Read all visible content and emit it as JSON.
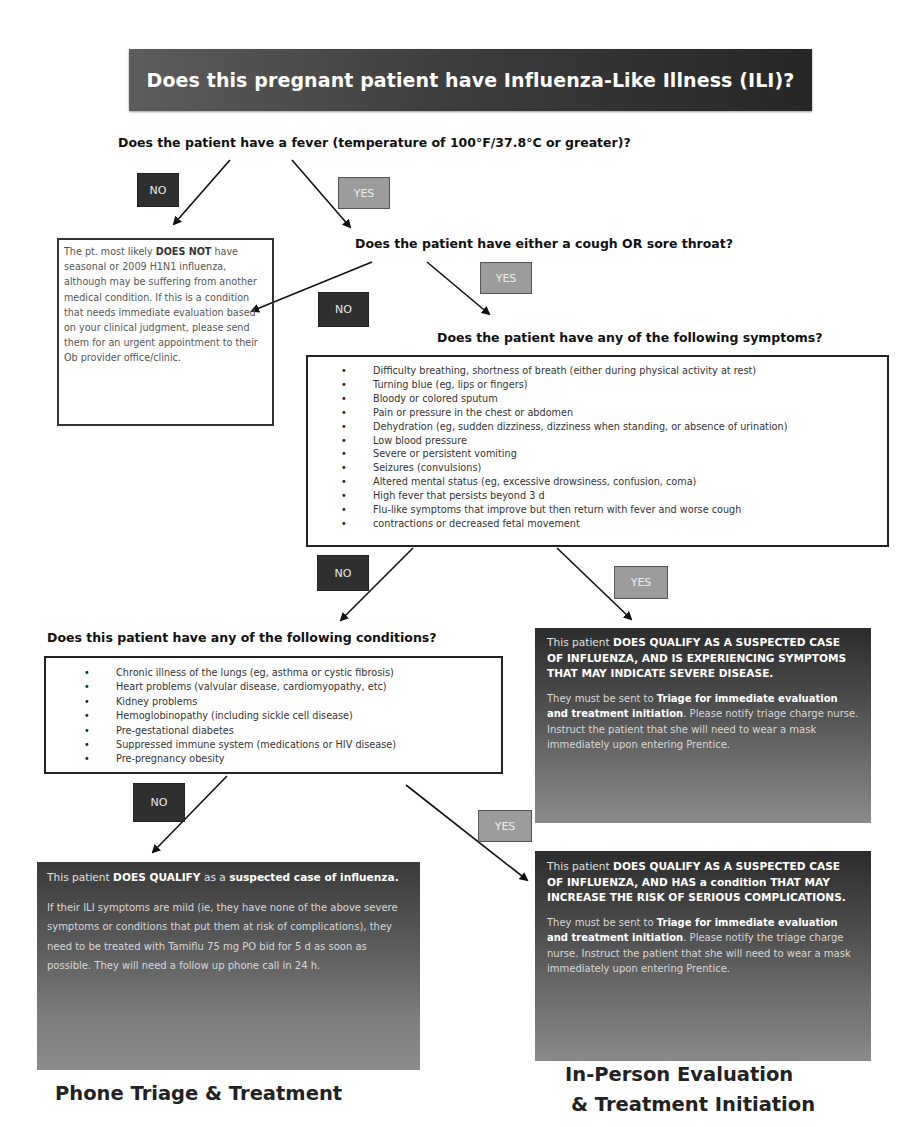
{
  "title": "Does this pregnant patient have Influenza-Like Illness (ILI)?",
  "questions": {
    "fever": "Does the patient have a fever (temperature of 100°F/37.8°C or greater)?",
    "cough": "Does the patient have either a cough OR sore throat?",
    "symptoms": "Does the patient have any of the following symptoms?",
    "conditions": "Does this patient have any of the following conditions?"
  },
  "branch_labels": {
    "no": "NO",
    "yes": "YES"
  },
  "not_influenza": {
    "prefix": "The pt. most likely ",
    "bold": "DOES NOT",
    "rest": " have seasonal or 2009 H1N1 influenza, although may be suffering from another medical condition. If this is a condition that needs immediate evaluation based on your clinical judgment, please send them for an urgent appointment to their Ob provider office/clinic."
  },
  "symptoms": [
    "Difficulty breathing, shortness of breath (either during physical activity at rest)",
    "Turning blue (eg, lips or fingers)",
    "Bloody or colored sputum",
    "Pain or pressure in the chest or abdomen",
    "Dehydration (eg, sudden dizziness, dizziness when standing, or absence of urination)",
    "Low blood pressure",
    "Severe or persistent vomiting",
    "Seizures (convulsions)",
    "Altered mental status (eg, excessive drowsiness, confusion, coma)",
    "High fever that persists beyond 3 d",
    "Flu-like symptoms that improve but then return with fever and worse cough",
    "contractions or decreased fetal movement"
  ],
  "conditions": [
    "Chronic illness of the lungs (eg, asthma or cystic fibrosis)",
    "Heart problems (valvular disease, cardiomyopathy, etc)",
    "Kidney problems",
    "Hemoglobinopathy (including sickle cell disease)",
    "Pre-gestational diabetes",
    "Suppressed immune system (medications or HIV disease)",
    "Pre-pregnancy obesity"
  ],
  "severe_disease": {
    "lead_prefix": "This patient ",
    "lead_caps": "DOES QUALIFY AS A SUSPECTED CASE OF INFLUENZA, AND IS EXPERIENCING SYMPTOMS THAT MAY INDICATE SEVERE DISEASE.",
    "body_prefix": "They must be sent to ",
    "body_bold": "Triage for immediate evaluation and treatment initiation",
    "body_rest": ".  Please notify triage charge nurse.  Instruct the patient that she will need to wear a mask immediately upon entering Prentice."
  },
  "risk_condition": {
    "lead_prefix": "This patient ",
    "lead_caps_1": "DOES QUALIFY AS A SUSPECTED CASE OF INFLUENZA, AND HAS",
    "lead_mid": " a condition ",
    "lead_caps_2": "THAT MAY INCREASE THE RISK OF SERIOUS COMPLICATIONS.",
    "body_prefix": "They must be sent to ",
    "body_bold": "Triage for immediate evaluation and treatment initiation",
    "body_rest": ".  Please notify the triage charge nurse.  Instruct the patient that she will need to wear a mask immediately upon entering Prentice."
  },
  "mild_case": {
    "lead_prefix": "This patient ",
    "lead_bold_1": "DOES QUALIFY",
    "lead_mid": " as a ",
    "lead_bold_2": "suspected case of influenza.",
    "body": "If their ILI symptoms are mild (ie, they have none of the above severe symptoms or conditions that put them at risk of complications), they need to be treated with Tamiflu 75 mg PO bid for 5 d  as soon as possible.  They will need a follow up phone call in 24 h."
  },
  "outcomes": {
    "phone": "Phone Triage & Treatment",
    "in_person_line1": "In-Person Evaluation",
    "in_person_line2": "& Treatment Initiation"
  }
}
